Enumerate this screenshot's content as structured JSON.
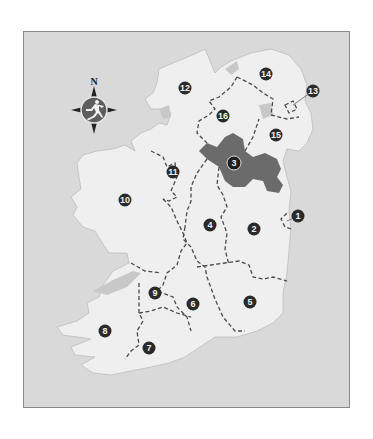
{
  "map": {
    "title": "Ireland regions map",
    "compass": {
      "north_label": "N",
      "icon": "running-man-compass-icon"
    },
    "colors": {
      "sea": "#d9d9d9",
      "land": "#efefef",
      "highlight": "#6b6b6b",
      "border": "#8a8a8a",
      "label_bg": "#2a2a2a",
      "label_text": "#f0f0f0",
      "lake": "#c4c4c4"
    },
    "highlighted_region": "3",
    "regions": [
      {
        "id": "1",
        "label": "1",
        "x": 297,
        "y": 215,
        "callout": true
      },
      {
        "id": "2",
        "label": "2",
        "x": 253,
        "y": 228
      },
      {
        "id": "3",
        "label": "3",
        "x": 233,
        "y": 162,
        "highlighted": true
      },
      {
        "id": "4",
        "label": "4",
        "x": 209,
        "y": 224
      },
      {
        "id": "5",
        "label": "5",
        "x": 249,
        "y": 301
      },
      {
        "id": "6",
        "label": "6",
        "x": 192,
        "y": 303
      },
      {
        "id": "7",
        "label": "7",
        "x": 148,
        "y": 347
      },
      {
        "id": "8",
        "label": "8",
        "x": 104,
        "y": 330
      },
      {
        "id": "9",
        "label": "9",
        "x": 154,
        "y": 292
      },
      {
        "id": "10",
        "label": "10",
        "x": 124,
        "y": 199
      },
      {
        "id": "11",
        "label": "11",
        "x": 172,
        "y": 171
      },
      {
        "id": "12",
        "label": "12",
        "x": 184,
        "y": 87
      },
      {
        "id": "13",
        "label": "13",
        "x": 312,
        "y": 90,
        "callout": true
      },
      {
        "id": "14",
        "label": "14",
        "x": 265,
        "y": 73
      },
      {
        "id": "15",
        "label": "15",
        "x": 275,
        "y": 134
      },
      {
        "id": "16",
        "label": "16",
        "x": 222,
        "y": 115
      }
    ]
  }
}
